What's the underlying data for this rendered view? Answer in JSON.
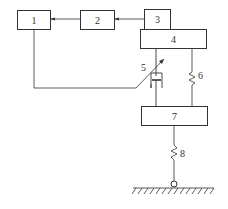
{
  "diagram": {
    "type": "block-schematic",
    "blocks": [
      {
        "id": "1",
        "label": "1"
      },
      {
        "id": "2",
        "label": "2"
      },
      {
        "id": "3",
        "label": "3"
      },
      {
        "id": "4",
        "label": "4"
      },
      {
        "id": "7",
        "label": "7"
      }
    ],
    "components": [
      {
        "id": "5",
        "label": "5",
        "kind": "adjustable-damper"
      },
      {
        "id": "6",
        "label": "6",
        "kind": "spring"
      },
      {
        "id": "8",
        "label": "8",
        "kind": "spring"
      }
    ],
    "connections": [
      {
        "from": "3",
        "to": "2",
        "arrow": true
      },
      {
        "from": "2",
        "to": "1",
        "arrow": true
      },
      {
        "from": "1",
        "to": "5",
        "arrow": false
      },
      {
        "from": "4",
        "to": "7",
        "via": "5"
      },
      {
        "from": "4",
        "to": "7",
        "via": "6"
      },
      {
        "from": "7",
        "to": "ground",
        "via": "8"
      }
    ],
    "colors": {
      "line": "#333333",
      "background": "#ffffff"
    }
  }
}
